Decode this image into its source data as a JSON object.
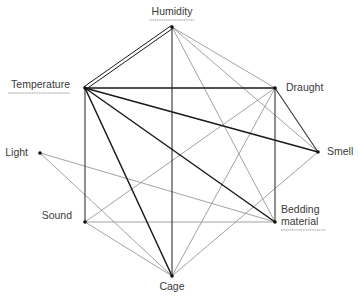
{
  "diagram": {
    "type": "network",
    "nodes": [
      {
        "id": "humidity",
        "label": "Humidity",
        "x": 172,
        "y": 27,
        "underlined": true,
        "label_x": 172,
        "label_y": 15,
        "anchor": "middle",
        "lines": [
          "Humidity"
        ]
      },
      {
        "id": "temperature",
        "label": "Temperature",
        "x": 85,
        "y": 88,
        "underlined": true,
        "label_x": 70,
        "label_y": 88,
        "anchor": "end",
        "lines": [
          "Temperature"
        ]
      },
      {
        "id": "draught",
        "label": "Draught",
        "x": 275,
        "y": 88,
        "underlined": false,
        "label_x": 286,
        "label_y": 91,
        "anchor": "start",
        "lines": [
          "Draught"
        ]
      },
      {
        "id": "light",
        "label": "Light",
        "x": 40,
        "y": 153,
        "underlined": false,
        "label_x": 28,
        "label_y": 156,
        "anchor": "end",
        "lines": [
          "Light"
        ]
      },
      {
        "id": "smell",
        "label": "Smell",
        "x": 318,
        "y": 152,
        "underlined": false,
        "label_x": 327,
        "label_y": 155,
        "anchor": "start",
        "lines": [
          "Smell"
        ]
      },
      {
        "id": "sound",
        "label": "Sound",
        "x": 85,
        "y": 222,
        "underlined": false,
        "label_x": 72,
        "label_y": 219,
        "anchor": "end",
        "lines": [
          "Sound"
        ]
      },
      {
        "id": "bedding",
        "label": "Bedding material",
        "x": 275,
        "y": 222,
        "underlined": true,
        "label_x": 281,
        "label_y": 213,
        "anchor": "start",
        "lines": [
          "Bedding",
          "material"
        ]
      },
      {
        "id": "cage",
        "label": "Cage",
        "x": 172,
        "y": 276,
        "underlined": false,
        "label_x": 172,
        "label_y": 290,
        "anchor": "middle",
        "lines": [
          "Cage"
        ]
      }
    ],
    "edges": [
      {
        "from": "humidity",
        "to": "temperature",
        "weight": "double"
      },
      {
        "from": "humidity",
        "to": "cage",
        "weight": "medium"
      },
      {
        "from": "humidity",
        "to": "draught",
        "weight": "thin"
      },
      {
        "from": "humidity",
        "to": "smell",
        "weight": "thin"
      },
      {
        "from": "humidity",
        "to": "bedding",
        "weight": "thin"
      },
      {
        "from": "temperature",
        "to": "draught",
        "weight": "thick"
      },
      {
        "from": "temperature",
        "to": "smell",
        "weight": "thick"
      },
      {
        "from": "temperature",
        "to": "bedding",
        "weight": "thick"
      },
      {
        "from": "temperature",
        "to": "cage",
        "weight": "thick"
      },
      {
        "from": "temperature",
        "to": "sound",
        "weight": "medium"
      },
      {
        "from": "draught",
        "to": "smell",
        "weight": "medium"
      },
      {
        "from": "draught",
        "to": "bedding",
        "weight": "medium"
      },
      {
        "from": "draught",
        "to": "sound",
        "weight": "thin"
      },
      {
        "from": "draught",
        "to": "cage",
        "weight": "thin"
      },
      {
        "from": "light",
        "to": "bedding",
        "weight": "thin"
      },
      {
        "from": "light",
        "to": "cage",
        "weight": "thin"
      },
      {
        "from": "sound",
        "to": "bedding",
        "weight": "thin"
      },
      {
        "from": "sound",
        "to": "cage",
        "weight": "thin"
      },
      {
        "from": "smell",
        "to": "cage",
        "weight": "thin"
      }
    ],
    "styles": {
      "thick": {
        "color": "#1a1a1a",
        "width": 1.5
      },
      "medium": {
        "color": "#333333",
        "width": 1.1
      },
      "thin": {
        "color": "#8a8a8a",
        "width": 0.8
      },
      "double": {
        "color": "#1a1a1a",
        "width": 1.0,
        "offset": 1.6
      }
    }
  }
}
